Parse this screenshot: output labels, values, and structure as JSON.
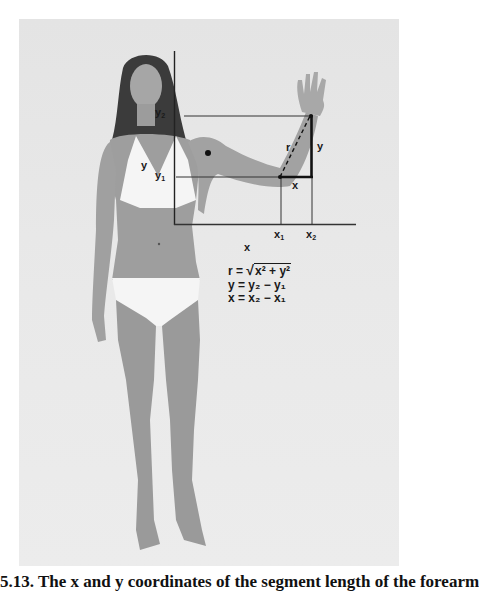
{
  "figure": {
    "labels": {
      "y2": "y",
      "y2_sub": "2",
      "y1": "y",
      "y1_sub": "1",
      "y_left": "y",
      "y_right": "y",
      "x_segment": "x",
      "r": "r",
      "x1": "x",
      "x1_sub": "1",
      "x2": "x",
      "x2_sub": "2",
      "x_axis": "x"
    },
    "equations": [
      "r = √(x² + y²)",
      "y = y₂ − y₁",
      "x = x₂ − x₁"
    ],
    "equation_parts": {
      "r_lhs": "r =",
      "r_rhs": "x² + y²",
      "y_eq": "y = y₂ − y₁",
      "x_eq": "x = x₂ − x₁"
    }
  },
  "caption": "5.13. The x and y coordinates of the segment length of the forearm",
  "colors": {
    "background": "#ffffff",
    "photo_bg": "#e6e6e6",
    "skin": "#9a9a9a",
    "swimsuit": "#f4f4f4",
    "hair": "#3a3a3a",
    "lines": "#222222"
  }
}
